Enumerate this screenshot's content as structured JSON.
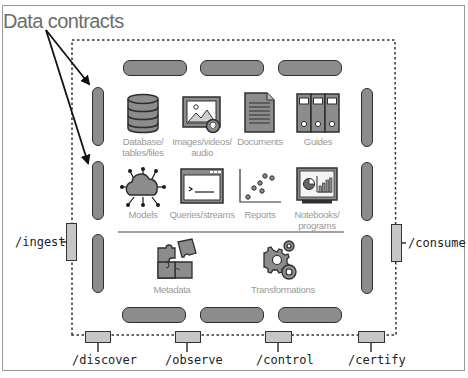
{
  "diagram": {
    "title": "Data contracts",
    "colors": {
      "bar_fill": "#8c8c8c",
      "bar_stroke": "#2e2e2e",
      "connector_fill": "#c6c6c6",
      "label_text": "#9a9a9a",
      "title_text": "#6d6d6d",
      "endpoint_text": "#222222"
    },
    "assets_row1": [
      {
        "icon": "database-icon",
        "label": "Database/\ntables/files"
      },
      {
        "icon": "image-icon",
        "label": "Images/videos/\naudio"
      },
      {
        "icon": "document-icon",
        "label": "Documents"
      },
      {
        "icon": "binders-icon",
        "label": "Guides"
      }
    ],
    "assets_row2": [
      {
        "icon": "cloud-network-icon",
        "label": "Models"
      },
      {
        "icon": "terminal-icon",
        "label": "Queries/streams"
      },
      {
        "icon": "scatter-plot-icon",
        "label": "Reports"
      },
      {
        "icon": "dashboard-icon",
        "label": "Notebooks/\nprograms"
      }
    ],
    "assets_row3": [
      {
        "icon": "puzzle-icon",
        "label": "Metadata"
      },
      {
        "icon": "gears-icon",
        "label": "Transformations"
      }
    ],
    "endpoints": {
      "left": "/ingest",
      "right": "/consume",
      "bottom": [
        "/discover",
        "/observe",
        "/control",
        "/certify"
      ]
    }
  }
}
